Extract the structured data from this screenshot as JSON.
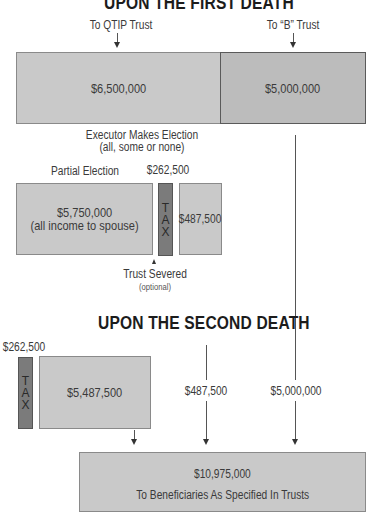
{
  "diagram": {
    "first_death": {
      "title": "UPON THE FIRST DEATH",
      "qtip_label": "To QTIP Trust",
      "b_trust_label": "To “B” Trust",
      "qtip_amount": "$6,500,000",
      "b_trust_amount": "$5,000,000",
      "executor_line1": "Executor Makes Election",
      "executor_line2": "(all, some or none)",
      "partial_election_label": "Partial Election",
      "tax_amount": "$262,500",
      "partial_amount": "$5,750,000",
      "partial_note": "(all income to spouse)",
      "tax_letters": [
        "T",
        "A",
        "X"
      ],
      "severed_amount": "$487,500",
      "trust_severed_label": "Trust Severed",
      "trust_severed_note": "(optional)"
    },
    "second_death": {
      "title": "UPON THE SECOND DEATH",
      "tax_amount": "$262,500",
      "tax_letters": [
        "T",
        "A",
        "X"
      ],
      "remaining_amount": "$5,487,500",
      "severed_amount": "$487,500",
      "b_trust_amount": "$5,000,000",
      "total_amount": "$10,975,000",
      "total_label": "To Beneficiaries As Specified In Trusts"
    },
    "colors": {
      "box_fill": "#c9c9c9",
      "b_trust_fill": "#bcbcbc",
      "tax_fill": "#7b7b7b",
      "line": "#555555",
      "title": "#1c1c1c"
    }
  }
}
